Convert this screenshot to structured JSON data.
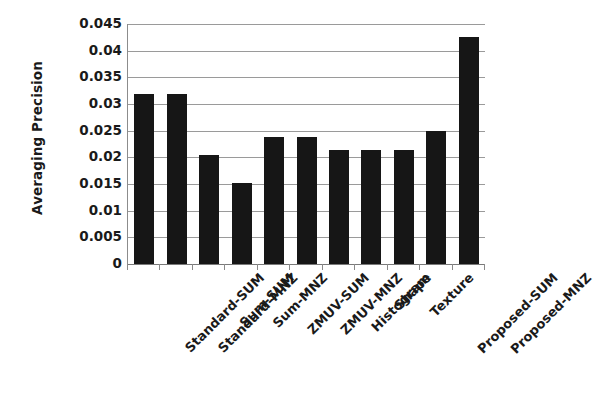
{
  "chart_data": {
    "type": "bar",
    "title": "",
    "xlabel": "",
    "ylabel": "Averaging Precision",
    "ylim": [
      0,
      0.045
    ],
    "yticks": [
      "0",
      "0.005",
      "0.01",
      "0.015",
      "0.02",
      "0.025",
      "0.03",
      "0.035",
      "0.04",
      "0.045"
    ],
    "ytick_values": [
      0,
      0.005,
      0.01,
      0.015,
      0.02,
      0.025,
      0.03,
      0.035,
      0.04,
      0.045
    ],
    "grid": true,
    "legend": false,
    "bar_color": "#161616",
    "gridline_color": "#9a9a9a",
    "background_color": "#ffffff",
    "categories": [
      "Standard-SUM",
      "Standard-MNZ",
      "Sum-SUM",
      "Sum-MNZ",
      "ZMUV-SUM",
      "ZMUV-MNZ",
      "Histogram",
      "Shape",
      "Texture",
      "Proposed-SUM",
      "Proposed-MNZ"
    ],
    "values": [
      0.0319,
      0.0319,
      0.0204,
      0.0152,
      0.0238,
      0.0238,
      0.0214,
      0.0214,
      0.0214,
      0.0249,
      0.0426
    ]
  }
}
